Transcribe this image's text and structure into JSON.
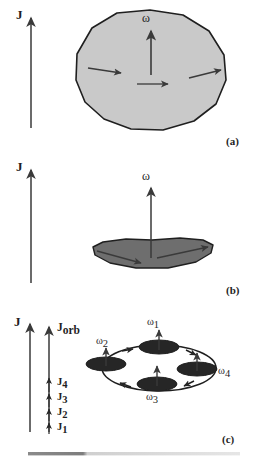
{
  "figure": {
    "caption_tags": [
      "(a)",
      "(b)",
      "(c)"
    ],
    "colors": {
      "background": "#ffffff",
      "stroke": "#1f1f1f",
      "blob_fill": "#c9c9c9",
      "disk_fill": "#6e6e6e",
      "ellipse_fill": "#262626",
      "arrow": "#3a3a3a",
      "rule_dark": "#7d7d7d",
      "rule_light": "#d8d8d8"
    }
  },
  "panel_a": {
    "tag": "(a)",
    "angular_momentum_label": "J",
    "spin_label": "ω",
    "description": "slowly rotating nearly spherical body",
    "body_shape": "irregular polygon blob",
    "internal_arrow_count": 3
  },
  "panel_b": {
    "tag": "(b)",
    "angular_momentum_label": "J",
    "spin_label": "ω",
    "description": "rapidly rotating flattened disk",
    "body_shape": "flattened polygon disk",
    "internal_arrow_count": 2
  },
  "panel_c": {
    "tag": "(c)",
    "angular_momentum_label": "J",
    "orbital_label": "J",
    "orbital_sub": "orb",
    "spin_labels": [
      {
        "base": "ω",
        "sub": "1"
      },
      {
        "base": "ω",
        "sub": "2"
      },
      {
        "base": "ω",
        "sub": "3"
      },
      {
        "base": "ω",
        "sub": "4"
      }
    ],
    "component_labels": [
      {
        "base": "J",
        "sub": "1"
      },
      {
        "base": "J",
        "sub": "2"
      },
      {
        "base": "J",
        "sub": "3"
      },
      {
        "base": "J",
        "sub": "4"
      }
    ],
    "description": "ring of four orbiting flattened bodies",
    "body_count": 4
  }
}
